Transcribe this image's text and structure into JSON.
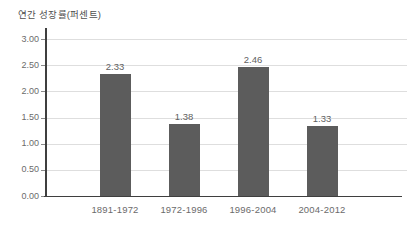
{
  "chart_data": {
    "type": "bar",
    "title": "연간 성장률(퍼센트)",
    "categories": [
      "1891-1972",
      "1972-1996",
      "1996-2004",
      "2004-2012"
    ],
    "values": [
      2.33,
      1.38,
      2.46,
      1.33
    ],
    "value_labels": [
      "2.33",
      "1.38",
      "2.46",
      "1.33"
    ],
    "xlabel": "",
    "ylabel": "",
    "ylim": [
      0,
      3
    ],
    "ytick_step": 0.5,
    "ytick_labels": [
      "0.00",
      "0.50",
      "1.00",
      "1.50",
      "2.00",
      "2.50",
      "3.00"
    ],
    "grid": true,
    "legend": false,
    "colors": {
      "bar": "#5c5c5c",
      "axis": "#3f3f3f",
      "gridline": "#dedede",
      "tick_text": "#6b6b6b",
      "value_text": "#5f5f5f",
      "background": "#ffffff"
    }
  }
}
